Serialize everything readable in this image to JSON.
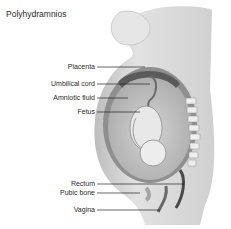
{
  "title": "Polyhydramnios",
  "labels": [
    {
      "id": "placenta",
      "text": "Placenta"
    },
    {
      "id": "umbilical-cord",
      "text": "Umbilical cord"
    },
    {
      "id": "amniotic-fluid",
      "text": "Amniotic fluid"
    },
    {
      "id": "fetus",
      "text": "Fetus"
    },
    {
      "id": "rectum",
      "text": "Rectum"
    },
    {
      "id": "pubic-bone",
      "text": "Pubic bone"
    },
    {
      "id": "vagina",
      "text": "Vagina"
    }
  ],
  "colors": {
    "background": "#ffffff",
    "text": "#2a2a2a",
    "skin": "#e4e4e4",
    "uterus_wall": "#8a8a8a",
    "fluid": "#c9c9c9",
    "fetus": "#e8e8e8",
    "leader_line": "#222222"
  }
}
